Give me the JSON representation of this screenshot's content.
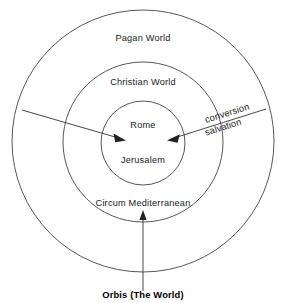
{
  "figure": {
    "caption": "Orbis (The World)",
    "background_color": "#ffffff",
    "stroke_color": "#444444",
    "text_color": "#1a1a1a"
  },
  "rings": [
    {
      "name": "outer-ring",
      "label": "Pagan World",
      "center": [
        143,
        141
      ],
      "radius": 131
    },
    {
      "name": "middle-ring",
      "label": "Christian World",
      "center": [
        143,
        142
      ],
      "radius": 80
    },
    {
      "name": "inner-ring",
      "label": "Rome",
      "center": [
        143,
        143
      ],
      "radius": 42
    }
  ],
  "core": {
    "primary_label": "Rome",
    "secondary_label": "Jerusalem"
  },
  "zone_label": {
    "circum_mediterranean": "Circum Mediterranean"
  },
  "flows": [
    {
      "name": "conversion-salvation-left-arrow",
      "label": "",
      "from": [
        22,
        110
      ],
      "to": [
        125,
        140
      ]
    },
    {
      "name": "conversion-salvation-right-arrow",
      "label_line_1": "conversion",
      "label_line_2": "salvation",
      "from": [
        266,
        109
      ],
      "to": [
        168,
        140
      ]
    },
    {
      "name": "orbis-inflow-arrow",
      "label": "Orbis (The World)",
      "from": [
        143,
        291
      ],
      "to": [
        143,
        211
      ]
    }
  ],
  "annotations": {
    "conversion": "conversion",
    "salvation": "salvation"
  }
}
